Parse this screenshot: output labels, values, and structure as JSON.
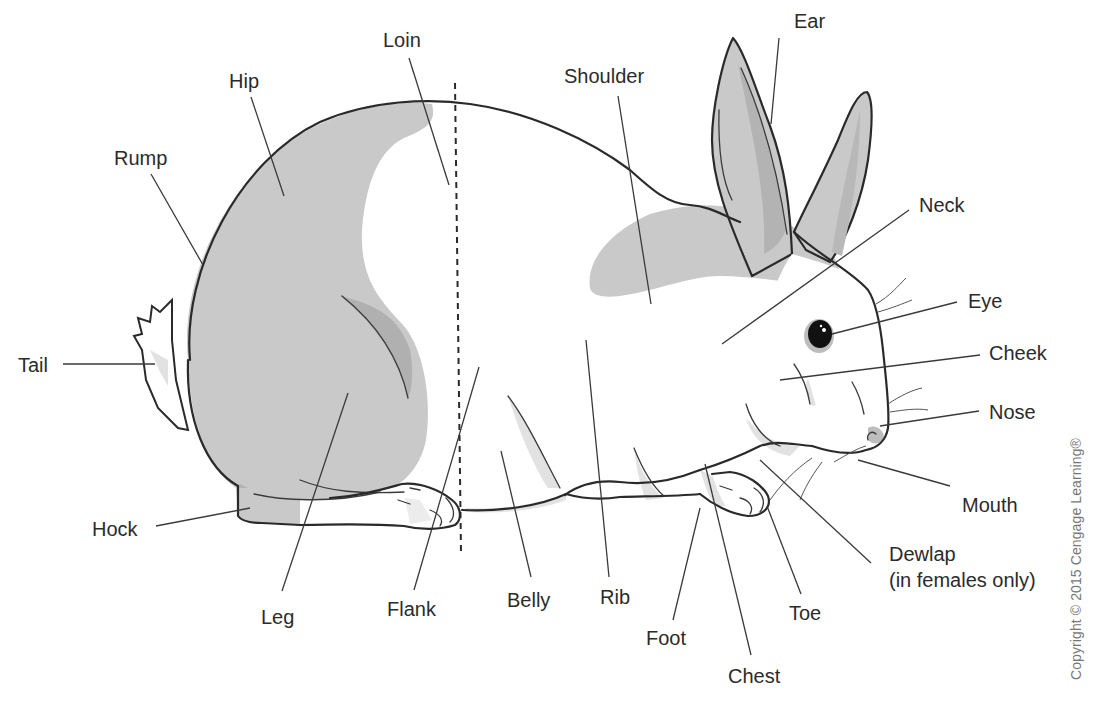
{
  "diagram": {
    "colors": {
      "background": "#ffffff",
      "fur_gray": "#c9c9c9",
      "fur_dark": "#b3b3b3",
      "fur_light": "#e2e2e2",
      "outline": "#2a2a2a",
      "text": "#2b2b2b"
    },
    "labels": {
      "ear": "Ear",
      "loin": "Loin",
      "hip": "Hip",
      "shoulder": "Shoulder",
      "rump": "Rump",
      "neck": "Neck",
      "eye": "Eye",
      "tail": "Tail",
      "cheek": "Cheek",
      "nose": "Nose",
      "mouth": "Mouth",
      "hock": "Hock",
      "dewlap": "Dewlap",
      "dewlap_note": "(in females only)",
      "leg": "Leg",
      "flank": "Flank",
      "belly": "Belly",
      "rib": "Rib",
      "toe": "Toe",
      "foot": "Foot",
      "chest": "Chest"
    },
    "copyright": "Copyright © 2015 Cengage Learning®"
  }
}
